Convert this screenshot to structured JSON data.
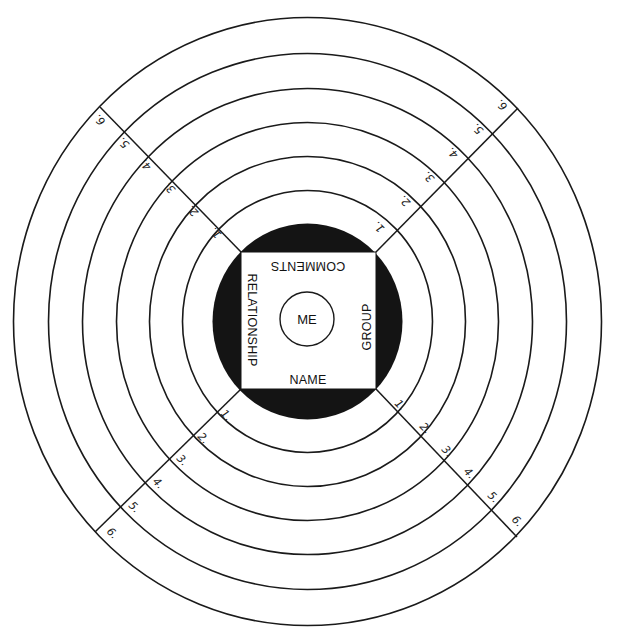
{
  "diagram": {
    "center_label": "ME",
    "square_labels": {
      "bottom": "NAME",
      "top": "COMMENTS",
      "left": "RELATIONSHIP",
      "right": "GROUP"
    },
    "rings": [
      "1",
      "2",
      "3",
      "4",
      "5",
      "6"
    ],
    "spokes": {
      "top_left": [
        "1.",
        "2.",
        "3.",
        "4.",
        "5.",
        "6."
      ],
      "top_right": [
        "1.",
        "2.",
        "3.",
        "4.",
        "5.",
        "6."
      ],
      "bottom_left": [
        "1.",
        "2.",
        "3.",
        "4.",
        "5.",
        "6."
      ],
      "bottom_right": [
        "1.",
        "2.",
        "3.",
        "4.",
        "5.",
        "6."
      ]
    },
    "colors": {
      "ink": "#141414",
      "paper": "#ffffff"
    }
  }
}
